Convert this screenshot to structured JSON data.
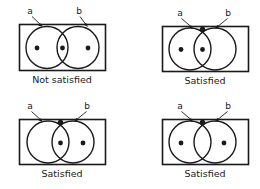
{
  "figure": {
    "background_color": "#ffffff",
    "stroke_color": "#1a1a1a",
    "dot_color": "#1a1a1a"
  },
  "panels": [
    {
      "id": "top-left",
      "caption": "Not satisfied",
      "label_a": "a",
      "label_b": "b",
      "dots": {
        "a_only": true,
        "intersection": true,
        "b_only": true,
        "boundary_top": false
      }
    },
    {
      "id": "top-right",
      "caption": "Satisfied",
      "label_a": "a",
      "label_b": "b",
      "dots": {
        "a_only": true,
        "intersection": true,
        "b_only": false,
        "boundary_top": true
      }
    },
    {
      "id": "bottom-left",
      "caption": "Satisfied",
      "label_a": "a",
      "label_b": "b",
      "dots": {
        "a_only": false,
        "intersection": true,
        "b_only": true,
        "boundary_top": true
      }
    },
    {
      "id": "bottom-right",
      "caption": "Satisfied",
      "label_a": "a",
      "label_b": "b",
      "dots": {
        "a_only": true,
        "intersection": false,
        "b_only": true,
        "boundary_top": true
      }
    }
  ]
}
